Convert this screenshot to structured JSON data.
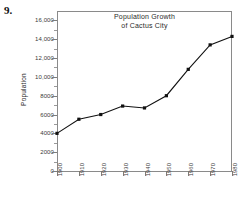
{
  "figure": {
    "number_label": "9."
  },
  "axis": {
    "y_title": "Population",
    "y_ticks": [
      "0",
      "2000",
      "4000",
      "6000",
      "8000",
      "10,000",
      "12,000",
      "14,000",
      "16,000"
    ],
    "x_ticks": [
      "1900",
      "1910",
      "1920",
      "1930",
      "1940",
      "1950",
      "1960",
      "1970",
      "1980"
    ]
  },
  "colors": {
    "line": "#111111",
    "axis": "#8a8a8a",
    "text": "#2a2a2a",
    "background": "#ffffff"
  },
  "chart_data": {
    "type": "line",
    "title": "Population Growth of Cactus City",
    "title_line1": "Population Growth",
    "title_line2": "of Cactus City",
    "xlabel": "",
    "ylabel": "Population",
    "categories": [
      "1900",
      "1910",
      "1920",
      "1930",
      "1940",
      "1950",
      "1960",
      "1970",
      "1980"
    ],
    "x": [
      1900,
      1910,
      1920,
      1930,
      1940,
      1950,
      1960,
      1970,
      1980
    ],
    "values": [
      4000,
      5500,
      6000,
      6900,
      6700,
      8000,
      10800,
      13400,
      14300
    ],
    "ylim": [
      0,
      17000
    ],
    "ytick_values": [
      0,
      2000,
      4000,
      6000,
      8000,
      10000,
      12000,
      14000,
      16000
    ],
    "y_minor_interval": 1000,
    "grid": false,
    "legend": false,
    "markers": "filled-square",
    "series": [
      {
        "name": "Population",
        "values": [
          4000,
          5500,
          6000,
          6900,
          6700,
          8000,
          10800,
          13400,
          14300
        ]
      }
    ]
  }
}
